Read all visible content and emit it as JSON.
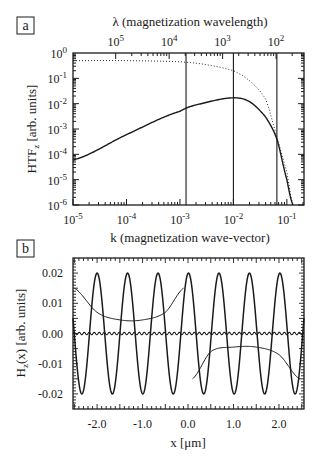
{
  "panel_a": {
    "label": "a",
    "top_axis_title": "λ (magnetization wavelength)",
    "top_ticks": [
      {
        "base": "10",
        "exp": "5",
        "k": 6.28e-05
      },
      {
        "base": "10",
        "exp": "4",
        "k": 0.000628
      },
      {
        "base": "10",
        "exp": "3",
        "k": 0.00628
      },
      {
        "base": "10",
        "exp": "2",
        "k": 0.0628
      }
    ],
    "xlabel": "k (magnetization wave-vector)",
    "ylabel_main": "HTF",
    "ylabel_sub": "z",
    "ylabel_rest": " [arb. units]",
    "x_ticks": [
      {
        "base": "10",
        "exp": "-5",
        "v": -5
      },
      {
        "base": "10",
        "exp": "-4",
        "v": -4
      },
      {
        "base": "10",
        "exp": "-3",
        "v": -3
      },
      {
        "base": "10",
        "exp": "-2",
        "v": -2
      },
      {
        "base": "10",
        "exp": "-1",
        "v": -1
      }
    ],
    "y_ticks": [
      {
        "base": "10",
        "exp": "0",
        "v": 0
      },
      {
        "base": "10",
        "exp": "-1",
        "v": -1
      },
      {
        "base": "10",
        "exp": "-2",
        "v": -2
      },
      {
        "base": "10",
        "exp": "-3",
        "v": -3
      },
      {
        "base": "10",
        "exp": "-4",
        "v": -4
      },
      {
        "base": "10",
        "exp": "-5",
        "v": -5
      },
      {
        "base": "10",
        "exp": "-6",
        "v": -6
      }
    ]
  },
  "panel_b": {
    "label": "b",
    "xlabel": "x [μm]",
    "ylabel_main": "H",
    "ylabel_sub": "z",
    "ylabel_rest": "(x) [arb. units]",
    "x_ticks": [
      "-2.0",
      "-1.0",
      "0.0",
      "1.0",
      "2.0"
    ],
    "x_tick_values": [
      -2,
      -1,
      0,
      1,
      2
    ],
    "y_ticks": [
      "0.02",
      "0.01",
      "0.00",
      "-0.01",
      "-0.02"
    ],
    "y_tick_values": [
      0.02,
      0.01,
      0.0,
      -0.01,
      -0.02
    ]
  },
  "chart_data": [
    {
      "type": "line",
      "title": "",
      "panel": "a",
      "xlabel": "k (magnetization wave-vector)",
      "ylabel": "HTFz [arb. units]",
      "secondary_xlabel": "λ (magnetization wavelength)",
      "xscale": "log",
      "yscale": "log",
      "xlim": [
        1e-05,
        0.2
      ],
      "ylim": [
        1e-06,
        1
      ],
      "grid": false,
      "vertical_lines_k": [
        0.0013,
        0.01,
        0.065
      ],
      "series": [
        {
          "name": "HTF (solid)",
          "style": "solid",
          "x": [
            1e-05,
            0.0001,
            0.001,
            0.003,
            0.01,
            0.02,
            0.04,
            0.065,
            0.1,
            0.13
          ],
          "y": [
            6e-05,
            0.0006,
            0.005,
            0.011,
            0.017,
            0.012,
            0.003,
            0.0004,
            1e-05,
            1e-06
          ]
        },
        {
          "name": "HTF envelope (dotted)",
          "style": "dotted",
          "x": [
            1e-05,
            0.0001,
            0.001,
            0.003,
            0.01,
            0.02,
            0.04,
            0.065,
            0.1,
            0.13
          ],
          "y": [
            0.5,
            0.5,
            0.45,
            0.35,
            0.2,
            0.08,
            0.015,
            0.0005,
            2e-05,
            1e-06
          ]
        }
      ]
    },
    {
      "type": "line",
      "title": "",
      "panel": "b",
      "xlabel": "x [μm]",
      "ylabel": "Hz(x) [arb. units]",
      "xlim": [
        -2.55,
        2.55
      ],
      "ylim": [
        -0.025,
        0.025
      ],
      "grid": false,
      "series": [
        {
          "name": "large-period oscillation",
          "style": "solid",
          "amplitude": 0.02,
          "period_um": 0.67,
          "peak_x_um": -2.0
        },
        {
          "name": "domain-edge field (upper)",
          "style": "thin",
          "x": [
            -2.5,
            -2.0,
            -1.5,
            -1.0,
            -0.5,
            -0.1
          ],
          "y": [
            0.015,
            0.007,
            0.0045,
            0.0045,
            0.007,
            0.015
          ]
        },
        {
          "name": "domain-edge field (lower)",
          "style": "thin",
          "x": [
            0.1,
            0.5,
            1.0,
            1.5,
            2.0,
            2.45
          ],
          "y": [
            -0.015,
            -0.006,
            -0.0045,
            -0.0045,
            -0.007,
            -0.015
          ]
        },
        {
          "name": "near-zero ripple",
          "style": "solid",
          "amplitude": 0.0004,
          "period_um": 0.11
        }
      ]
    }
  ]
}
